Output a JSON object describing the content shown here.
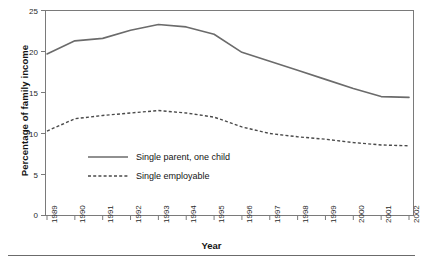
{
  "chart_data": {
    "type": "line",
    "title": "",
    "xlabel": "Year",
    "ylabel": "Percentage of family income",
    "categories": [
      "1989",
      "1990",
      "1991",
      "1992",
      "1993",
      "1994",
      "1995",
      "1996",
      "1997",
      "1998",
      "1999",
      "2000",
      "2001",
      "2002"
    ],
    "xlim": [
      1989,
      2002
    ],
    "ylim": [
      0,
      25
    ],
    "yticks": [
      0,
      5,
      10,
      15,
      20,
      25
    ],
    "grid": false,
    "legend_position": "inside-lower-left",
    "series": [
      {
        "name": "Single parent, one child",
        "style": "solid",
        "color": "#6b6b6b",
        "values": [
          19.7,
          21.3,
          21.6,
          22.6,
          23.3,
          23.0,
          22.1,
          19.9,
          18.8,
          17.7,
          16.6,
          15.5,
          14.5,
          14.4
        ]
      },
      {
        "name": "Single employable",
        "style": "dashed",
        "color": "#4a4a4a",
        "values": [
          10.3,
          11.8,
          12.2,
          12.5,
          12.8,
          12.5,
          12.0,
          10.8,
          10.0,
          9.6,
          9.3,
          8.9,
          8.6,
          8.5
        ]
      }
    ]
  },
  "axes": {
    "y_title": "Percentage of family income",
    "x_title": "Year",
    "y_tick_labels": [
      "25",
      "20",
      "15",
      "10",
      "5",
      "0"
    ],
    "x_tick_labels": [
      "1989",
      "1990",
      "1991",
      "1992",
      "1993",
      "1994",
      "1995",
      "1996",
      "1997",
      "1998",
      "1999",
      "2000",
      "2001",
      "2002"
    ]
  },
  "legend": {
    "items": [
      {
        "label": "Single parent, one child",
        "style": "solid"
      },
      {
        "label": "Single employable",
        "style": "dashed"
      }
    ]
  },
  "colors": {
    "series_solid": "#6b6b6b",
    "series_dashed": "#4a4a4a",
    "axis": "#5a5a5a",
    "rule": "#666666",
    "text": "#141414"
  }
}
